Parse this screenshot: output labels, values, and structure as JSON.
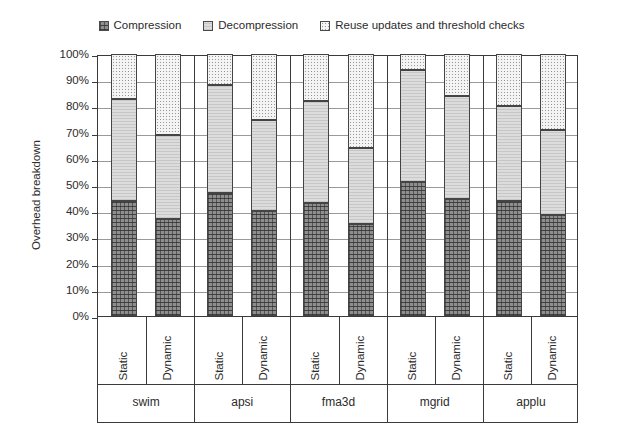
{
  "chart_data": {
    "type": "bar",
    "title": "",
    "xlabel": "",
    "ylabel": "Overhead breakdown",
    "ylim": [
      0,
      100
    ],
    "stacked": true,
    "normalized_percent": true,
    "grid": true,
    "legend_position": "top-center",
    "tick_labels": [
      "100%",
      "90%",
      "80%",
      "70%",
      "60%",
      "50%",
      "40%",
      "30%",
      "20%",
      "10%",
      "0%"
    ],
    "tick_values": [
      100,
      90,
      80,
      70,
      60,
      50,
      40,
      30,
      20,
      10,
      0
    ],
    "groups": [
      "swim",
      "apsi",
      "fma3d",
      "mgrid",
      "applu"
    ],
    "subcategories": [
      "Static",
      "Dynamic"
    ],
    "categories": [
      "swim Static",
      "swim Dynamic",
      "apsi Static",
      "apsi Dynamic",
      "fma3d Static",
      "fma3d Dynamic",
      "mgrid Static",
      "mgrid Dynamic",
      "applu Static",
      "applu Dynamic"
    ],
    "series": [
      {
        "name": "Compression",
        "color": "#8e8e8e",
        "pattern": "cross-hatch-dark",
        "values": [
          44,
          37,
          47,
          40,
          43,
          35,
          51,
          44.5,
          44,
          38.5
        ]
      },
      {
        "name": "Decompression",
        "color": "#dcdcdc",
        "pattern": "light-solid",
        "values": [
          39,
          32,
          41,
          35,
          39,
          29,
          43,
          39.5,
          36,
          32.5
        ]
      },
      {
        "name": "Reuse updates and threshold checks",
        "color": "#f4f4f4",
        "pattern": "fine-dots",
        "values": [
          17,
          31,
          12,
          25,
          18,
          36,
          6,
          16,
          20,
          29
        ]
      }
    ],
    "cumulative_tops": [
      {
        "category": "swim Static",
        "compression": 44,
        "decompression_top": 83,
        "total": 100
      },
      {
        "category": "swim Dynamic",
        "compression": 37,
        "decompression_top": 69,
        "total": 100
      },
      {
        "category": "apsi Static",
        "compression": 47,
        "decompression_top": 88,
        "total": 100
      },
      {
        "category": "apsi Dynamic",
        "compression": 40,
        "decompression_top": 75,
        "total": 100
      },
      {
        "category": "fma3d Static",
        "compression": 43,
        "decompression_top": 82,
        "total": 100
      },
      {
        "category": "fma3d Dynamic",
        "compression": 35,
        "decompression_top": 64,
        "total": 100
      },
      {
        "category": "mgrid Static",
        "compression": 51,
        "decompression_top": 94,
        "total": 100
      },
      {
        "category": "mgrid Dynamic",
        "compression": 44.5,
        "decompression_top": 84,
        "total": 100
      },
      {
        "category": "applu Static",
        "compression": 44,
        "decompression_top": 80,
        "total": 100
      },
      {
        "category": "applu Dynamic",
        "compression": 38.5,
        "decompression_top": 71,
        "total": 100
      }
    ]
  },
  "legend": {
    "items": [
      {
        "label": "Compression"
      },
      {
        "label": "Decompression"
      },
      {
        "label": "Reuse updates and threshold checks"
      }
    ]
  },
  "axis": {
    "y_title": "Overhead breakdown"
  }
}
